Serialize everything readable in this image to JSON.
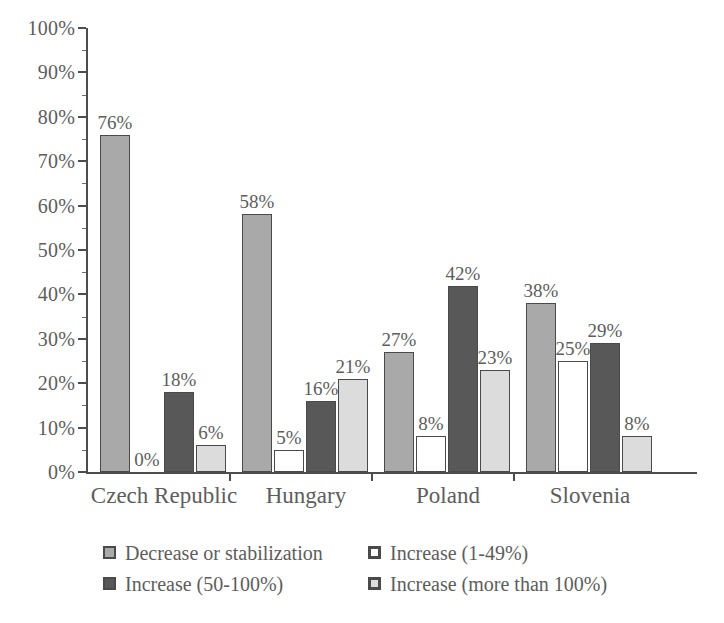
{
  "chart_data": {
    "type": "bar",
    "title": "",
    "xlabel": "",
    "ylabel": "",
    "ylim": [
      0,
      100
    ],
    "y_tick_labels": [
      "0%",
      "10%",
      "20%",
      "30%",
      "40%",
      "50%",
      "60%",
      "70%",
      "80%",
      "90%",
      "100%"
    ],
    "y_tick_values": [
      0,
      10,
      20,
      30,
      40,
      50,
      60,
      70,
      80,
      90,
      100
    ],
    "grid": false,
    "legend_position": "bottom",
    "value_suffix": "%",
    "categories": [
      "Czech Republic",
      "Hungary",
      "Poland",
      "Slovenia"
    ],
    "series": [
      {
        "name": "Decrease or stabilization",
        "color": "#a9a9a9",
        "values": [
          76,
          58,
          27,
          38
        ],
        "labels": [
          "76%",
          "58%",
          "27%",
          "38%"
        ]
      },
      {
        "name": "Increase (1-49%)",
        "color": "#ffffff",
        "values": [
          0,
          5,
          8,
          25
        ],
        "labels": [
          "0%",
          "5%",
          "8%",
          "25%"
        ]
      },
      {
        "name": "Increase (50-100%)",
        "color": "#585858",
        "values": [
          18,
          16,
          42,
          29
        ],
        "labels": [
          "18%",
          "16%",
          "42%",
          "29%"
        ]
      },
      {
        "name": "Increase (more than 100%)",
        "color": "#dcdcdc",
        "values": [
          6,
          21,
          23,
          8
        ],
        "labels": [
          "6%",
          "21%",
          "23%",
          "8%"
        ]
      }
    ]
  }
}
